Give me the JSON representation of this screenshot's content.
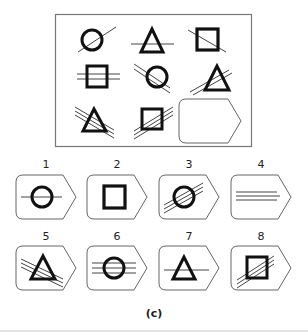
{
  "puzzle": {
    "description": "3x3 figure matrix with missing bottom-right cell",
    "grid": [
      {
        "cell": 1,
        "shape": "circle",
        "lines": 1,
        "line_direction": "up-right"
      },
      {
        "cell": 2,
        "shape": "triangle",
        "lines": 1,
        "line_direction": "horizontal"
      },
      {
        "cell": 3,
        "shape": "square",
        "lines": 1,
        "line_direction": "down-right"
      },
      {
        "cell": 4,
        "shape": "square",
        "lines": 2,
        "line_direction": "horizontal"
      },
      {
        "cell": 5,
        "shape": "circle",
        "lines": 2,
        "line_direction": "down-right"
      },
      {
        "cell": 6,
        "shape": "triangle",
        "lines": 2,
        "line_direction": "up-right"
      },
      {
        "cell": 7,
        "shape": "triangle",
        "lines": 3,
        "line_direction": "down-right"
      },
      {
        "cell": 8,
        "shape": "square",
        "lines": 3,
        "line_direction": "up-right"
      },
      {
        "cell": 9,
        "shape": "empty",
        "lines": 0,
        "line_direction": "none"
      }
    ]
  },
  "options": [
    {
      "label": "1",
      "shape": "circle",
      "lines": 1,
      "line_direction": "horizontal"
    },
    {
      "label": "2",
      "shape": "square",
      "lines": 0,
      "line_direction": "none"
    },
    {
      "label": "3",
      "shape": "circle",
      "lines": 3,
      "line_direction": "up-right"
    },
    {
      "label": "4",
      "shape": "none",
      "lines": 3,
      "line_direction": "horizontal"
    },
    {
      "label": "5",
      "shape": "triangle",
      "lines": 3,
      "line_direction": "down-right"
    },
    {
      "label": "6",
      "shape": "circle",
      "lines": 3,
      "line_direction": "horizontal"
    },
    {
      "label": "7",
      "shape": "triangle",
      "lines": 1,
      "line_direction": "horizontal"
    },
    {
      "label": "8",
      "shape": "square",
      "lines": 3,
      "line_direction": "up-right"
    }
  ],
  "caption": "(c)",
  "colors": {
    "ink": "#111111",
    "frame": "#777777",
    "thin_line": "#444444"
  }
}
